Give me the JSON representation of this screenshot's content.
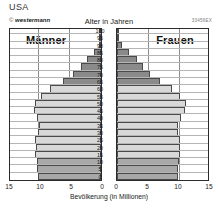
{
  "title": "USA",
  "credit": {
    "symbol": "©",
    "brand": "westermann"
  },
  "axis_title_top": "Alter in Jahren",
  "code": "33456EX",
  "labels": {
    "male": "Männer",
    "female": "Frauen"
  },
  "xaxis": {
    "title": "Bevölkerung (in Millionen)",
    "ticks_left": [
      "15",
      "10",
      "5",
      "0"
    ],
    "ticks_right": [
      "0",
      "5",
      "10",
      "15"
    ],
    "max": 15
  },
  "yaxis": {
    "ticks": [
      "100",
      "95",
      "90",
      "85",
      "80",
      "75",
      "70",
      "65",
      "60",
      "55",
      "50",
      "45",
      "40",
      "35",
      "30",
      "25",
      "20",
      "15",
      "10",
      "5",
      "0"
    ]
  },
  "colors": {
    "bar_old": "#8a8a8a",
    "bar_mid": "#d8d8d8",
    "bar_young": "#a8a8a8",
    "frame": "#2b2b2b",
    "grid": "#8d8d8d"
  },
  "chart_data": {
    "type": "bar",
    "title": "USA",
    "subtitle": "Alter in Jahren",
    "xlabel": "Bevölkerung (in Millionen)",
    "ylabel": "Alter in Jahren",
    "orientation": "population-pyramid",
    "xlim": [
      0,
      15
    ],
    "grid": true,
    "legend": [
      "Männer",
      "Frauen"
    ],
    "categories": [
      "0-4",
      "5-9",
      "10-14",
      "15-19",
      "20-24",
      "25-29",
      "30-34",
      "35-39",
      "40-44",
      "45-49",
      "50-54",
      "55-59",
      "60-64",
      "65-69",
      "70-74",
      "75-79",
      "80-84",
      "85-89",
      "90-94",
      "95-99",
      "100+"
    ],
    "series": [
      {
        "name": "Männer",
        "values": [
          10.2,
          10.3,
          10.4,
          10.7,
          10.5,
          10.6,
          10.1,
          10.0,
          10.3,
          10.8,
          10.6,
          9.6,
          8.2,
          6.2,
          4.5,
          3.3,
          2.2,
          1.1,
          0.4,
          0.1,
          0.03
        ]
      },
      {
        "name": "Frauen",
        "values": [
          9.8,
          9.9,
          10.0,
          10.2,
          10.1,
          10.2,
          9.9,
          9.9,
          10.4,
          11.0,
          11.1,
          10.2,
          8.9,
          6.9,
          5.3,
          4.2,
          3.2,
          1.9,
          0.8,
          0.2,
          0.05
        ]
      }
    ]
  }
}
